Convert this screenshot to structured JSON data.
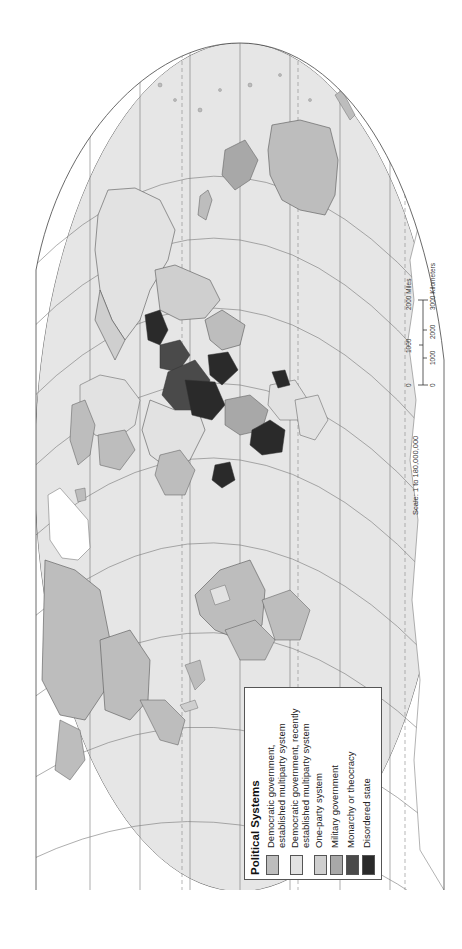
{
  "map": {
    "projection_hint": "world map rotated 90 degrees counter-clockwise",
    "ocean_color": "#e6e6e6",
    "border_color": "#555555",
    "gridline_color": "#777777"
  },
  "legend": {
    "title": "Political Systems",
    "items": [
      {
        "label": "Democratic government,\nestablished multiparty system",
        "color": "#bdbdbd"
      },
      {
        "label": "Democratic government, recently\nestablished multiparty system",
        "color": "#e2e2e2"
      },
      {
        "label": "One-party system",
        "color": "#cfcfcf"
      },
      {
        "label": "Military government",
        "color": "#a8a8a8"
      },
      {
        "label": "Monarchy or theocracy",
        "color": "#4a4a4a"
      },
      {
        "label": "Disordered state",
        "color": "#2a2a2a"
      }
    ]
  },
  "scale": {
    "text": "Scale: 1 to 180,000,000",
    "miles_ticks": [
      "0",
      "1000",
      "2000 Miles"
    ],
    "km_ticks": [
      "0",
      "1000",
      "2000",
      "3000 Kilometers"
    ]
  }
}
